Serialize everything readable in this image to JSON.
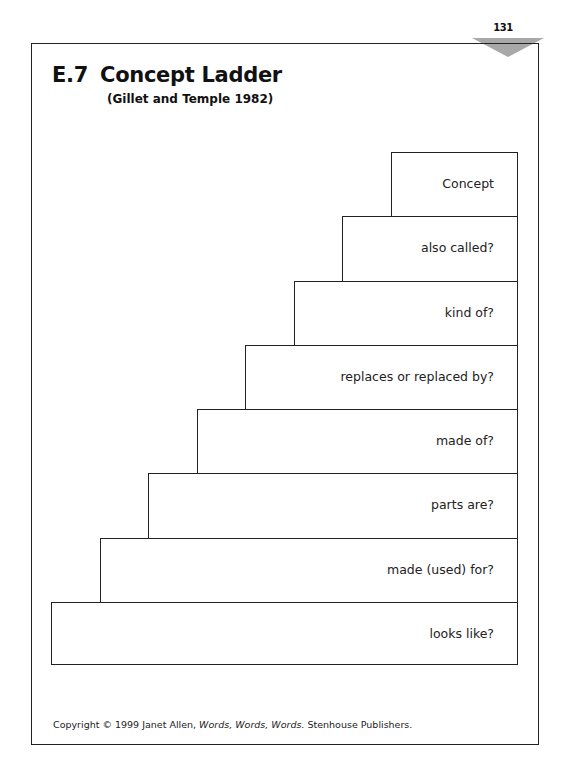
{
  "page": {
    "number": "131",
    "tab_color": "#a8a8a8"
  },
  "header": {
    "section": "E.7",
    "title": "Concept Ladder",
    "subtitle": "(Gillet and Temple 1982)"
  },
  "ladder": {
    "steps": [
      {
        "label": "Concept"
      },
      {
        "label": "also called?"
      },
      {
        "label": "kind of?"
      },
      {
        "label": "replaces or replaced by?"
      },
      {
        "label": "made of?"
      },
      {
        "label": "parts are?"
      },
      {
        "label": "made (used) for?"
      },
      {
        "label": "looks like?"
      }
    ]
  },
  "footer": {
    "prefix": "Copyright © 1999 Janet Allen, ",
    "book_title": "Words, Words, Words.",
    "suffix": " Stenhouse Publishers."
  }
}
